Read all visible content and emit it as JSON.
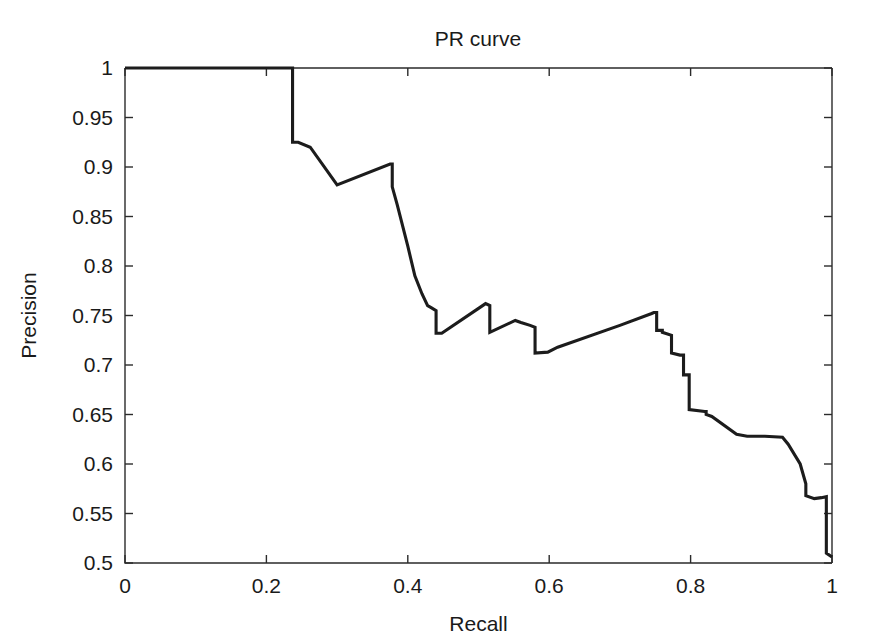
{
  "figure": {
    "background_color": "#ffffff",
    "foreground_color": "#1a1a1a"
  },
  "chart_data": {
    "type": "line",
    "title": "PR curve",
    "xlabel": "Recall",
    "ylabel": "Precision",
    "xlim": [
      0,
      1
    ],
    "ylim": [
      0.5,
      1
    ],
    "grid": false,
    "legend": null,
    "line_color": "#1c1c1c",
    "xticks": [
      0,
      0.2,
      0.4,
      0.6,
      0.8,
      1
    ],
    "xtick_labels": [
      "0",
      "0.2",
      "0.4",
      "0.6",
      "0.8",
      "1"
    ],
    "yticks": [
      0.5,
      0.55,
      0.6,
      0.65,
      0.7,
      0.75,
      0.8,
      0.85,
      0.9,
      0.95,
      1
    ],
    "ytick_labels": [
      "0.5",
      "0.55",
      "0.6",
      "0.65",
      "0.7",
      "0.75",
      "0.8",
      "0.85",
      "0.9",
      "0.95",
      "1"
    ],
    "series": [
      {
        "name": "PR curve",
        "x": [
          0.0,
          0.237,
          0.237,
          0.245,
          0.262,
          0.262,
          0.3,
          0.3,
          0.375,
          0.378,
          0.378,
          0.385,
          0.4,
          0.41,
          0.42,
          0.428,
          0.428,
          0.433,
          0.433,
          0.44,
          0.44,
          0.448,
          0.51,
          0.51,
          0.516,
          0.516,
          0.552,
          0.552,
          0.56,
          0.573,
          0.573,
          0.58,
          0.58,
          0.598,
          0.598,
          0.612,
          0.7,
          0.745,
          0.748,
          0.752,
          0.752,
          0.76,
          0.76,
          0.773,
          0.773,
          0.785,
          0.79,
          0.79,
          0.798,
          0.798,
          0.82,
          0.822,
          0.822,
          0.83,
          0.865,
          0.88,
          0.905,
          0.93,
          0.93,
          0.938,
          0.955,
          0.955,
          0.963,
          0.963,
          0.975,
          0.985,
          0.985,
          0.992,
          0.992,
          1.0
        ],
        "y": [
          1.0,
          1.0,
          0.925,
          0.925,
          0.92,
          0.92,
          0.882,
          0.882,
          0.903,
          0.903,
          0.88,
          0.862,
          0.82,
          0.79,
          0.772,
          0.76,
          0.76,
          0.758,
          0.758,
          0.755,
          0.732,
          0.732,
          0.762,
          0.762,
          0.76,
          0.733,
          0.745,
          0.745,
          0.743,
          0.74,
          0.74,
          0.738,
          0.712,
          0.713,
          0.713,
          0.718,
          0.74,
          0.752,
          0.753,
          0.753,
          0.735,
          0.735,
          0.733,
          0.73,
          0.712,
          0.71,
          0.71,
          0.69,
          0.69,
          0.655,
          0.653,
          0.653,
          0.65,
          0.648,
          0.63,
          0.628,
          0.628,
          0.627,
          0.627,
          0.62,
          0.6,
          0.6,
          0.58,
          0.568,
          0.565,
          0.566,
          0.566,
          0.567,
          0.51,
          0.506
        ]
      }
    ],
    "annotations": []
  }
}
